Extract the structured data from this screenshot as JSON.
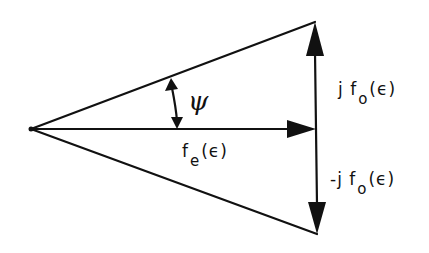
{
  "diagram": {
    "type": "phasor-vector-diagram",
    "colors": {
      "stroke": "#111111",
      "background": "#ffffff"
    },
    "vertices": {
      "origin": [
        31,
        129
      ],
      "horizontal_tip": [
        316,
        129
      ],
      "top": [
        315,
        22
      ],
      "bottom": [
        317,
        234
      ]
    },
    "vectors": [
      {
        "name": "fe",
        "from": "origin",
        "to": "horizontal_tip",
        "label": "f_e(ε)"
      },
      {
        "name": "jfo",
        "from": "horizontal_tip",
        "to": "top",
        "label": "j f_o(ε)"
      },
      {
        "name": "minus-jfo",
        "from": "horizontal_tip",
        "to": "bottom",
        "label": "-j f_o(ε)"
      }
    ],
    "angle": {
      "symbol": "ψ",
      "between": [
        "origin→top",
        "origin→horizontal_tip"
      ]
    },
    "labels": {
      "psi": "ψ",
      "fe_main": "f",
      "fe_sub": "e",
      "fe_arg": "(ϵ)",
      "jfo_prefix": "j",
      "jfo_main": "f",
      "jfo_sub": "o",
      "jfo_arg": "(ϵ)",
      "mjfo_prefix": "-j",
      "mjfo_main": "f",
      "mjfo_sub": "o",
      "mjfo_arg": "(ϵ)"
    }
  }
}
